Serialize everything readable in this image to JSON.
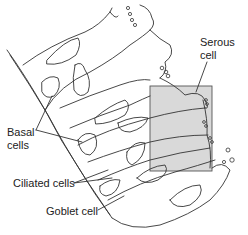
{
  "labels": {
    "serous": [
      "Serous",
      "cell"
    ],
    "basal": [
      "Basal",
      "cells"
    ],
    "ciliated": "Ciliated cells",
    "goblet": "Goblet cell"
  },
  "colors": {
    "highlight_box": "#d9d9d9",
    "highlight_border": "#555555",
    "line": "#333333"
  }
}
